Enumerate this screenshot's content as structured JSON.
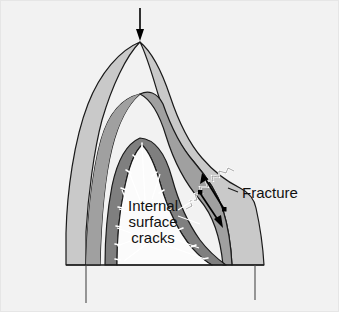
{
  "figure": {
    "width": 339,
    "height": 312,
    "background_color": "#f2f2f2",
    "border_color": "#e0e0e0"
  },
  "colors": {
    "outer_layer": "#c9c9c9",
    "middle_layer": "#a0a0a0",
    "inner_band": "#7f7f7f",
    "cavity": "#fbfbfb",
    "outline": "#1a1a1a",
    "leader_line": "#ffffff",
    "label_text": "#111111",
    "arrow": "#000000",
    "fracture_line": "#ffffff"
  },
  "labels": {
    "fracture": "Fracture",
    "internal": "Internal",
    "surface": "surface",
    "cracks": "cracks"
  },
  "annotations": {
    "load_arrow": {
      "name": "load-arrow",
      "direction": "down",
      "x": 140,
      "y_start": 8,
      "y_end": 41
    },
    "fracture_arrows": [
      {
        "name": "fracture-arrow-upper",
        "direction": "up-left",
        "x1": 226,
        "y1": 210,
        "x2": 203,
        "y2": 176
      },
      {
        "name": "fracture-arrow-lower",
        "direction": "down-right",
        "x1": 203,
        "y1": 192,
        "x2": 227,
        "y2": 227
      }
    ],
    "fracture_label_position": {
      "x": 244,
      "y": 193
    },
    "crack_label_position": {
      "x": 152,
      "y": 209
    }
  },
  "layers": [
    {
      "name": "outer-layer",
      "label": "outer shell",
      "fill": "#c9c9c9"
    },
    {
      "name": "middle-layer",
      "label": "middle shell",
      "fill": "#a0a0a0"
    },
    {
      "name": "inner-band",
      "label": "inner band",
      "fill": "#7f7f7f"
    },
    {
      "name": "cavity",
      "label": "cavity",
      "fill": "#fbfbfb"
    }
  ],
  "crack_ticks_count": 14,
  "leader_lines_count": 10
}
